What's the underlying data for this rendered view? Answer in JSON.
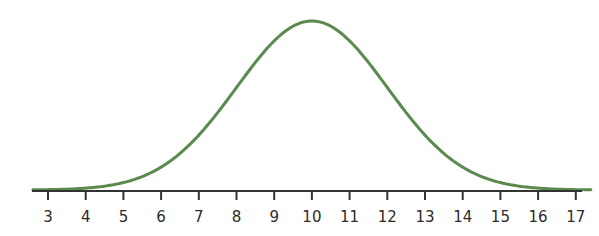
{
  "chart_data": {
    "type": "line",
    "title": "",
    "xlabel": "",
    "ylabel": "",
    "distribution": {
      "mean": 10,
      "sd": 2
    },
    "x_ticks": [
      3,
      4,
      5,
      6,
      7,
      8,
      9,
      10,
      11,
      12,
      13,
      14,
      15,
      16,
      17
    ],
    "tick_labels": [
      "3",
      "4",
      "5",
      "6",
      "7",
      "8",
      "9",
      "10",
      "11",
      "12",
      "13",
      "14",
      "15",
      "16",
      "17"
    ],
    "xlim": [
      2.6,
      17.4
    ],
    "grid": false,
    "legend": null,
    "y_axis_visible": false,
    "series": [
      {
        "name": "normal-curve",
        "color": "#5a8a4e",
        "x": [
          2.6,
          3,
          4,
          5,
          6,
          7,
          8,
          9,
          10,
          11,
          12,
          13,
          14,
          15,
          16,
          17,
          17.4
        ],
        "y": [
          0.0021,
          0.0044,
          0.0111,
          0.0222,
          0.054,
          0.1295,
          0.242,
          0.3521,
          0.3989,
          0.3521,
          0.242,
          0.1295,
          0.054,
          0.0222,
          0.0111,
          0.0044,
          0.0021
        ]
      }
    ]
  },
  "colors": {
    "curve": "#5a8a4e",
    "axis": "#333333",
    "text": "#2b2b2b",
    "background": "#ffffff"
  }
}
